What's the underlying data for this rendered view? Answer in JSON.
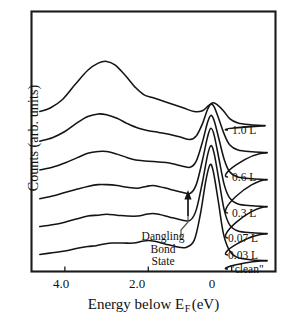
{
  "chart_data": {
    "type": "line",
    "title": "",
    "xlabel": "Energy below E F (eV)",
    "xlabel_main": "Energy below E",
    "xlabel_sub": "F",
    "xlabel_unit": "(eV)",
    "ylabel": "Counts (arb. units)",
    "xlim": [
      4.8,
      -1.05
    ],
    "xticks": [
      4.0,
      2.0,
      0
    ],
    "xtick_labels": [
      "4.0",
      "2.0",
      "0"
    ],
    "yticks": [],
    "ytick_labels": [],
    "grid": false,
    "legend_position": "right-inline",
    "series": [
      {
        "name": "1.0 L",
        "label": "1.0 L",
        "offset_index": 5,
        "points": [
          [
            4.6,
            0.13
          ],
          [
            4.35,
            0.17
          ],
          [
            4.05,
            0.27
          ],
          [
            3.75,
            0.44
          ],
          [
            3.45,
            0.6
          ],
          [
            3.2,
            0.68
          ],
          [
            3.0,
            0.7
          ],
          [
            2.8,
            0.66
          ],
          [
            2.55,
            0.54
          ],
          [
            2.3,
            0.4
          ],
          [
            2.1,
            0.32
          ],
          [
            1.9,
            0.29
          ],
          [
            1.65,
            0.25
          ],
          [
            1.4,
            0.21
          ],
          [
            1.15,
            0.17
          ],
          [
            0.9,
            0.13
          ],
          [
            0.7,
            0.14
          ],
          [
            0.55,
            0.2
          ],
          [
            0.45,
            0.23
          ],
          [
            0.35,
            0.21
          ],
          [
            0.2,
            0.14
          ],
          [
            0.05,
            0.05
          ],
          [
            -0.15,
            0.0
          ],
          [
            -0.45,
            -0.02
          ],
          [
            -0.8,
            -0.03
          ]
        ]
      },
      {
        "name": "0.6 L",
        "label": "0.6 L",
        "offset_index": 4,
        "points": [
          [
            4.6,
            0.1
          ],
          [
            4.3,
            0.14
          ],
          [
            4.0,
            0.21
          ],
          [
            3.7,
            0.31
          ],
          [
            3.45,
            0.38
          ],
          [
            3.2,
            0.41
          ],
          [
            3.0,
            0.4
          ],
          [
            2.75,
            0.36
          ],
          [
            2.5,
            0.3
          ],
          [
            2.25,
            0.25
          ],
          [
            2.0,
            0.22
          ],
          [
            1.75,
            0.2
          ],
          [
            1.5,
            0.18
          ],
          [
            1.25,
            0.15
          ],
          [
            1.0,
            0.12
          ],
          [
            0.85,
            0.16
          ],
          [
            0.7,
            0.3
          ],
          [
            0.58,
            0.46
          ],
          [
            0.5,
            0.52
          ],
          [
            0.42,
            0.49
          ],
          [
            0.3,
            0.34
          ],
          [
            0.18,
            0.18
          ],
          [
            0.05,
            0.06
          ],
          [
            -0.15,
            0.0
          ],
          [
            -0.5,
            -0.02
          ],
          [
            -0.85,
            -0.03
          ]
        ]
      },
      {
        "name": "0.3 L",
        "label": "0.3 L",
        "offset_index": 3,
        "points": [
          [
            4.6,
            0.08
          ],
          [
            4.3,
            0.11
          ],
          [
            4.0,
            0.16
          ],
          [
            3.7,
            0.22
          ],
          [
            3.45,
            0.27
          ],
          [
            3.2,
            0.29
          ],
          [
            3.0,
            0.29
          ],
          [
            2.75,
            0.26
          ],
          [
            2.5,
            0.22
          ],
          [
            2.25,
            0.19
          ],
          [
            2.0,
            0.18
          ],
          [
            1.75,
            0.17
          ],
          [
            1.5,
            0.16
          ],
          [
            1.25,
            0.13
          ],
          [
            1.0,
            0.11
          ],
          [
            0.85,
            0.18
          ],
          [
            0.7,
            0.4
          ],
          [
            0.58,
            0.62
          ],
          [
            0.5,
            0.7
          ],
          [
            0.42,
            0.64
          ],
          [
            0.3,
            0.42
          ],
          [
            0.18,
            0.2
          ],
          [
            0.05,
            0.06
          ],
          [
            -0.15,
            0.0
          ],
          [
            -0.5,
            -0.02
          ],
          [
            -0.85,
            -0.03
          ]
        ]
      },
      {
        "name": "0.07 L",
        "label": "0.07 L",
        "offset_index": 2,
        "points": [
          [
            4.6,
            0.06
          ],
          [
            4.3,
            0.09
          ],
          [
            4.0,
            0.13
          ],
          [
            3.7,
            0.17
          ],
          [
            3.45,
            0.2
          ],
          [
            3.2,
            0.22
          ],
          [
            3.0,
            0.22
          ],
          [
            2.75,
            0.21
          ],
          [
            2.5,
            0.19
          ],
          [
            2.25,
            0.18
          ],
          [
            2.05,
            0.2
          ],
          [
            1.9,
            0.21
          ],
          [
            1.75,
            0.2
          ],
          [
            1.5,
            0.17
          ],
          [
            1.25,
            0.14
          ],
          [
            1.0,
            0.12
          ],
          [
            0.85,
            0.22
          ],
          [
            0.7,
            0.5
          ],
          [
            0.58,
            0.76
          ],
          [
            0.5,
            0.86
          ],
          [
            0.42,
            0.78
          ],
          [
            0.3,
            0.5
          ],
          [
            0.18,
            0.22
          ],
          [
            0.05,
            0.07
          ],
          [
            -0.15,
            0.0
          ],
          [
            -0.5,
            -0.02
          ],
          [
            -0.85,
            -0.03
          ]
        ]
      },
      {
        "name": "0.03 L",
        "label": "0.03 L",
        "offset_index": 1,
        "points": [
          [
            4.6,
            0.05
          ],
          [
            4.3,
            0.07
          ],
          [
            4.0,
            0.1
          ],
          [
            3.7,
            0.14
          ],
          [
            3.45,
            0.17
          ],
          [
            3.2,
            0.18
          ],
          [
            3.0,
            0.19
          ],
          [
            2.75,
            0.18
          ],
          [
            2.5,
            0.17
          ],
          [
            2.25,
            0.17
          ],
          [
            2.05,
            0.19
          ],
          [
            1.9,
            0.2
          ],
          [
            1.75,
            0.19
          ],
          [
            1.5,
            0.16
          ],
          [
            1.25,
            0.13
          ],
          [
            1.0,
            0.12
          ],
          [
            0.85,
            0.24
          ],
          [
            0.7,
            0.56
          ],
          [
            0.58,
            0.86
          ],
          [
            0.5,
            0.97
          ],
          [
            0.42,
            0.88
          ],
          [
            0.3,
            0.56
          ],
          [
            0.18,
            0.24
          ],
          [
            0.05,
            0.07
          ],
          [
            -0.15,
            0.0
          ],
          [
            -0.5,
            -0.02
          ],
          [
            -0.85,
            -0.03
          ]
        ]
      },
      {
        "name": "clean",
        "label": "\"clean\"",
        "offset_index": 0,
        "points": [
          [
            4.6,
            0.04
          ],
          [
            4.3,
            0.06
          ],
          [
            4.0,
            0.08
          ],
          [
            3.7,
            0.11
          ],
          [
            3.45,
            0.13
          ],
          [
            3.25,
            0.14
          ],
          [
            3.05,
            0.16
          ],
          [
            2.85,
            0.17
          ],
          [
            2.6,
            0.17
          ],
          [
            2.35,
            0.17
          ],
          [
            2.15,
            0.19
          ],
          [
            2.0,
            0.2
          ],
          [
            1.85,
            0.19
          ],
          [
            1.6,
            0.16
          ],
          [
            1.35,
            0.13
          ],
          [
            1.1,
            0.12
          ],
          [
            0.9,
            0.2
          ],
          [
            0.75,
            0.5
          ],
          [
            0.62,
            0.88
          ],
          [
            0.52,
            1.06
          ],
          [
            0.44,
            0.98
          ],
          [
            0.32,
            0.64
          ],
          [
            0.2,
            0.28
          ],
          [
            0.06,
            0.09
          ],
          [
            -0.12,
            0.01
          ],
          [
            -0.45,
            -0.02
          ],
          [
            -0.85,
            -0.03
          ]
        ]
      }
    ],
    "annotation": {
      "lines": [
        "Dangling",
        "Bond",
        "State"
      ],
      "text": "Dangling Bond State",
      "arrow": "up-arrow"
    },
    "colors": {
      "line": "#141414",
      "frame": "#1a1a1a",
      "background": "#ffffff",
      "text": "#111111"
    }
  }
}
